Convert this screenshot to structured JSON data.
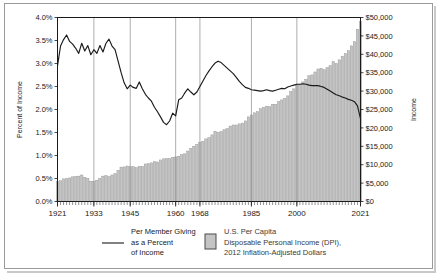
{
  "chart_data": {
    "type": "line",
    "title": "",
    "xlabel": "",
    "ylabel": "Percent of Income",
    "y2label": "Income",
    "grid": true,
    "legend_position": "bottom",
    "xlim": [
      1921,
      2021
    ],
    "ylim": [
      0,
      4.0
    ],
    "y2lim": [
      0,
      50000
    ],
    "x_tick_labels": [
      "1921",
      "1933",
      "1945",
      "1960",
      "1968",
      "1985",
      "2000",
      "2021"
    ],
    "x_tick_values": [
      1921,
      1933,
      1945,
      1960,
      1968,
      1985,
      2000,
      2021
    ],
    "y_tick_labels": [
      "0.0%",
      "0.5%",
      "1.0%",
      "1.5%",
      "2.0%",
      "2.5%",
      "3.0%",
      "3.5%",
      "4.0%"
    ],
    "y_tick_values": [
      0,
      0.5,
      1.0,
      1.5,
      2.0,
      2.5,
      3.0,
      3.5,
      4.0
    ],
    "y2_tick_labels": [
      "$0",
      "$5,000",
      "$10,000",
      "$15,000",
      "$20,000",
      "$25,000",
      "$30,000",
      "$35,000",
      "$40,000",
      "$45,000",
      "$50,000"
    ],
    "y2_tick_values": [
      0,
      5000,
      10000,
      15000,
      20000,
      25000,
      30000,
      35000,
      40000,
      45000,
      50000
    ],
    "x": [
      1921,
      1922,
      1923,
      1924,
      1925,
      1926,
      1927,
      1928,
      1929,
      1930,
      1931,
      1932,
      1933,
      1934,
      1935,
      1936,
      1937,
      1938,
      1939,
      1940,
      1941,
      1942,
      1943,
      1944,
      1945,
      1946,
      1947,
      1948,
      1949,
      1950,
      1951,
      1952,
      1953,
      1954,
      1955,
      1956,
      1957,
      1958,
      1959,
      1960,
      1961,
      1962,
      1963,
      1964,
      1965,
      1966,
      1967,
      1968,
      1969,
      1970,
      1971,
      1972,
      1973,
      1974,
      1975,
      1976,
      1977,
      1978,
      1979,
      1980,
      1981,
      1982,
      1983,
      1984,
      1985,
      1986,
      1987,
      1988,
      1989,
      1990,
      1991,
      1992,
      1993,
      1994,
      1995,
      1996,
      1997,
      1998,
      1999,
      2000,
      2001,
      2002,
      2003,
      2004,
      2005,
      2006,
      2007,
      2008,
      2009,
      2010,
      2011,
      2012,
      2013,
      2014,
      2015,
      2016,
      2017,
      2018,
      2019,
      2020,
      2021
    ],
    "series": [
      {
        "name": "Per Member Giving as a Percent of Income",
        "axis": "left",
        "unit": "percent",
        "color": "#1a1a1a",
        "style": "line",
        "values": [
          2.95,
          3.38,
          3.52,
          3.62,
          3.48,
          3.42,
          3.33,
          3.22,
          3.44,
          3.27,
          3.39,
          3.19,
          3.3,
          3.22,
          3.39,
          3.25,
          3.44,
          3.53,
          3.38,
          3.3,
          3.05,
          2.8,
          2.58,
          2.45,
          2.53,
          2.48,
          2.46,
          2.6,
          2.45,
          2.33,
          2.25,
          2.18,
          2.05,
          1.95,
          1.84,
          1.72,
          1.67,
          1.75,
          1.92,
          1.86,
          2.21,
          2.25,
          2.36,
          2.45,
          2.38,
          2.32,
          2.38,
          2.5,
          2.62,
          2.74,
          2.84,
          2.93,
          3.01,
          3.05,
          3.02,
          2.96,
          2.9,
          2.84,
          2.78,
          2.7,
          2.61,
          2.54,
          2.48,
          2.46,
          2.43,
          2.42,
          2.41,
          2.4,
          2.41,
          2.43,
          2.41,
          2.4,
          2.42,
          2.44,
          2.46,
          2.45,
          2.49,
          2.51,
          2.53,
          2.55,
          2.55,
          2.56,
          2.55,
          2.53,
          2.52,
          2.52,
          2.52,
          2.5,
          2.48,
          2.44,
          2.4,
          2.36,
          2.32,
          2.3,
          2.27,
          2.25,
          2.22,
          2.2,
          2.17,
          2.08,
          1.8
        ]
      },
      {
        "name": "U.S. Per Capita Disposable Personal Income (DPI), 2012 Inflation-Adjusted Dollars",
        "axis": "right",
        "unit": "dollars",
        "color": "#b8b8b8",
        "style": "bar",
        "values": [
          5400,
          5650,
          6150,
          6250,
          6400,
          6700,
          6750,
          6900,
          7200,
          6600,
          6250,
          5500,
          5450,
          5800,
          6250,
          6900,
          7050,
          6750,
          7200,
          7600,
          8500,
          9350,
          9400,
          9650,
          9500,
          9450,
          9200,
          9600,
          9550,
          10200,
          10300,
          10500,
          10800,
          10750,
          11300,
          11600,
          11700,
          11650,
          12000,
          12100,
          12300,
          12700,
          12950,
          13700,
          14400,
          15000,
          15500,
          16050,
          16350,
          17000,
          17350,
          18100,
          19100,
          18800,
          19000,
          19500,
          19800,
          20500,
          20800,
          20800,
          21100,
          21300,
          21900,
          23000,
          23500,
          24100,
          24400,
          25200,
          25600,
          25900,
          25800,
          26400,
          26400,
          27100,
          27600,
          28000,
          28700,
          29900,
          30600,
          31600,
          31900,
          32500,
          33200,
          34200,
          34400,
          35200,
          36000,
          36200,
          35800,
          36400,
          36900,
          38000,
          37500,
          38500,
          39500,
          40200,
          41000,
          42300,
          43400,
          46800,
          48900
        ]
      }
    ],
    "legend": [
      {
        "marker": "line",
        "label_lines": [
          "Per Member Giving",
          "as a Percent",
          "of Income"
        ]
      },
      {
        "marker": "swatch",
        "label_lines": [
          "U.S. Per Capita",
          "Disposable Personal Income (DPI),",
          "2012 Inflation-Adjusted Dollars"
        ]
      }
    ]
  }
}
